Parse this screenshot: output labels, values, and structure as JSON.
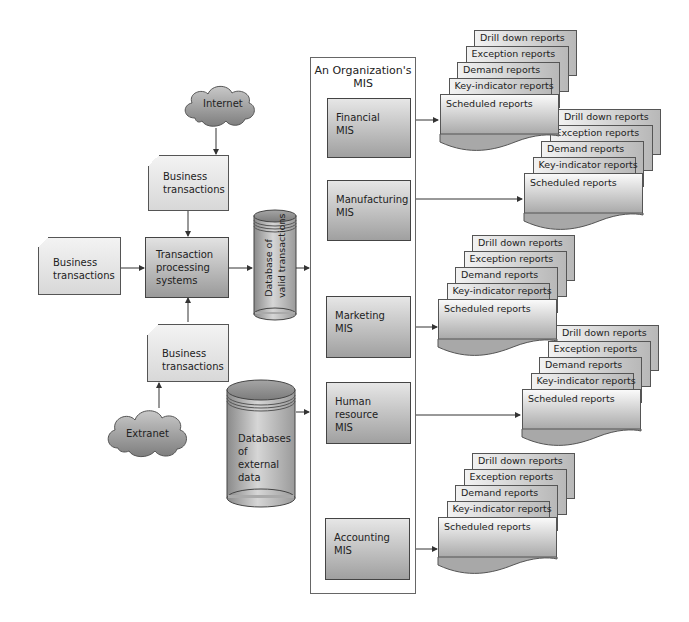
{
  "sources": {
    "internet": "Internet",
    "extranet": "Extranet"
  },
  "documents": {
    "top": [
      "Business",
      "transactions"
    ],
    "left": [
      "Business",
      "transactions"
    ],
    "bottom": [
      "Business",
      "transactions"
    ]
  },
  "tps": [
    "Transaction",
    "processing",
    "systems"
  ],
  "databases": {
    "valid": [
      "Database of",
      "valid transactions"
    ],
    "external": [
      "Databases",
      "of",
      "external",
      "data"
    ]
  },
  "mis_container": {
    "title": [
      "An Organization's",
      "MIS"
    ],
    "subsystems": [
      {
        "lines": [
          "Financial",
          "MIS"
        ]
      },
      {
        "lines": [
          "Manufacturing",
          "MIS"
        ]
      },
      {
        "lines": [
          "Marketing",
          "MIS"
        ]
      },
      {
        "lines": [
          "Human",
          "resource",
          "MIS"
        ]
      },
      {
        "lines": [
          "Accounting",
          "MIS"
        ]
      }
    ]
  },
  "reports": [
    "Drill down reports",
    "Exception reports",
    "Demand reports",
    "Key-indicator reports",
    "Scheduled reports"
  ],
  "colors": {
    "line": "#444444",
    "box_top": "#e4e4e4",
    "box_bottom": "#9c9c9c",
    "cloud": "#9a9a9a"
  }
}
